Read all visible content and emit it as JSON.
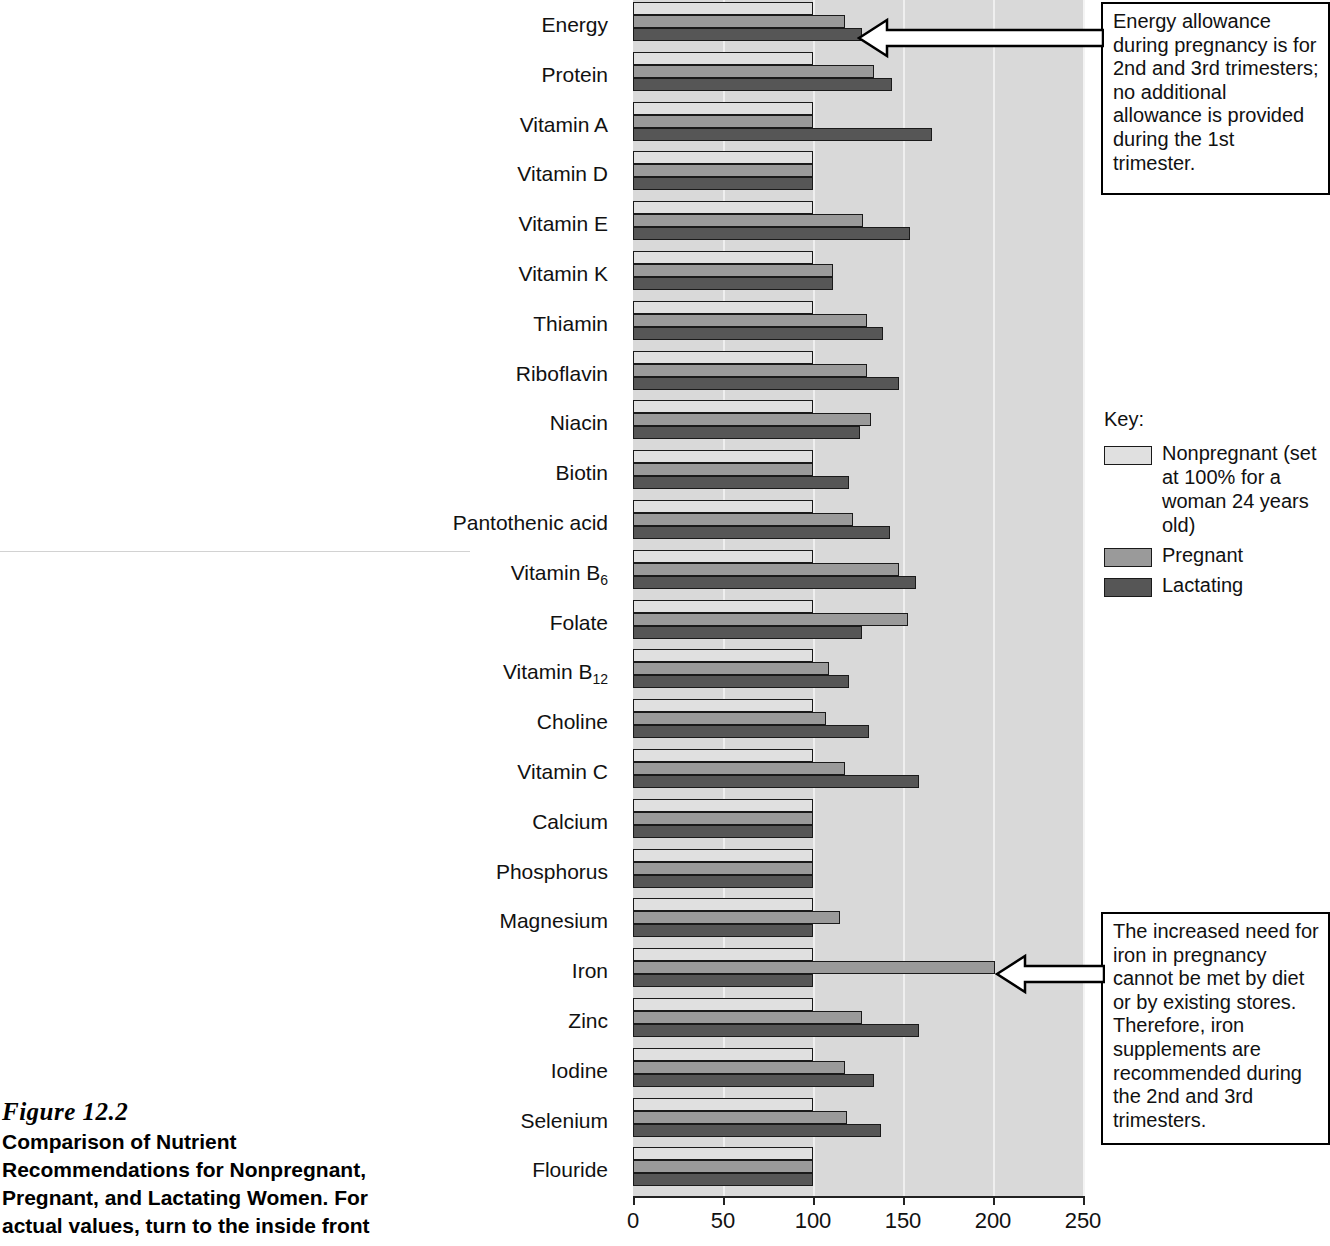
{
  "figure": {
    "number": "Figure 12.2",
    "caption": "Comparison of Nutrient Recommendations for Nonpregnant, Pregnant, and Lactating Women. For actual values, turn to the inside front"
  },
  "key": {
    "title": "Key:",
    "items": [
      {
        "label": "Nonpregnant (set at 100% for a woman 24 years old)",
        "color": "#e0e0e0"
      },
      {
        "label": "Pregnant",
        "color": "#9a9a9a"
      },
      {
        "label": "Lactating",
        "color": "#565656"
      }
    ]
  },
  "callouts": [
    {
      "id": "energy",
      "text": "Energy allowance during pregnancy is for 2nd and 3rd trimesters; no additional allowance is provided during the 1st trimester.",
      "points_to": "Energy"
    },
    {
      "id": "iron",
      "text": "The increased need for iron in pregnancy cannot be met by diet or by existing stores. Therefore, iron supplements are recommended during the 2nd and 3rd trimesters.",
      "points_to": "Iron"
    }
  ],
  "chart_data": {
    "type": "bar",
    "orientation": "horizontal",
    "title": "Comparison of Nutrient Recommendations for Nonpregnant, Pregnant, and Lactating Women",
    "xlabel": "",
    "ylabel": "",
    "xlim": [
      0,
      250
    ],
    "xticks": [
      0,
      50,
      100,
      150,
      200,
      250
    ],
    "grid": true,
    "legend_position": "right",
    "categories": [
      "Energy",
      "Protein",
      "Vitamin A",
      "Vitamin D",
      "Vitamin E",
      "Vitamin K",
      "Thiamin",
      "Riboflavin",
      "Niacin",
      "Biotin",
      "Pantothenic acid",
      "Vitamin B6",
      "Folate",
      "Vitamin B12",
      "Choline",
      "Vitamin C",
      "Calcium",
      "Phosphorus",
      "Magnesium",
      "Iron",
      "Zinc",
      "Iodine",
      "Selenium",
      "Flouride"
    ],
    "series": [
      {
        "name": "Nonpregnant",
        "color": "#e0e0e0",
        "values": [
          100,
          100,
          100,
          100,
          100,
          100,
          100,
          100,
          100,
          100,
          100,
          100,
          100,
          100,
          100,
          100,
          100,
          100,
          100,
          100,
          100,
          100,
          100,
          100
        ]
      },
      {
        "name": "Pregnant",
        "color": "#9a9a9a",
        "values": [
          118,
          134,
          100,
          100,
          128,
          111,
          130,
          130,
          132,
          100,
          122,
          148,
          153,
          109,
          107,
          118,
          100,
          100,
          115,
          201,
          127,
          118,
          119,
          100
        ]
      },
      {
        "name": "Lactating",
        "color": "#565656",
        "values": [
          127,
          144,
          166,
          100,
          154,
          111,
          139,
          148,
          126,
          120,
          143,
          157,
          127,
          120,
          131,
          159,
          100,
          100,
          100,
          100,
          159,
          134,
          138,
          100
        ]
      }
    ]
  }
}
